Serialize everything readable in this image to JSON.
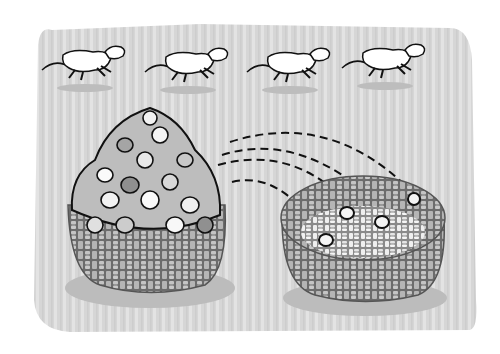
{
  "illustration": {
    "title": "Sheep jumping while stones move from a full basket to an empty basket",
    "background_color": "#d4d4d4",
    "stripe_color": "#e2e2e2",
    "sheep": [
      {
        "x": 45,
        "y": 40
      },
      {
        "x": 148,
        "y": 42
      },
      {
        "x": 250,
        "y": 42
      },
      {
        "x": 345,
        "y": 38
      }
    ],
    "full_basket": {
      "label": "full basket of stones"
    },
    "empty_basket": {
      "label": "basket with a few stones",
      "stones_count": 4
    },
    "flight_paths_count": 4
  }
}
